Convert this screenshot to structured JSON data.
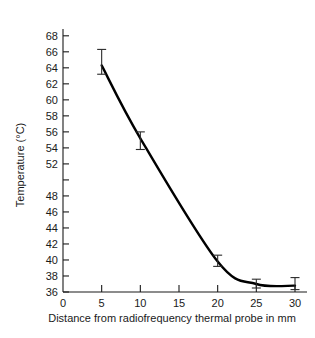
{
  "chart_data": {
    "type": "line",
    "title": "",
    "subtitle": "",
    "xlabel": "Distance from radiofrequency thermal probe in mm",
    "ylabel": "Temperature (°C)",
    "x": [
      5,
      10,
      20,
      25,
      30
    ],
    "values": [
      64.3,
      55.2,
      39.8,
      37.0,
      36.8
    ],
    "error_upper": [
      66.3,
      56.0,
      40.6,
      37.6,
      37.8
    ],
    "error_lower": [
      63.2,
      53.8,
      39.2,
      36.5,
      36.3
    ],
    "series": [
      {
        "name": "Temperature",
        "values": [
          64.3,
          55.2,
          39.8,
          37.0,
          36.8
        ]
      }
    ],
    "xlim": [
      0,
      31
    ],
    "ylim": [
      36,
      68.6
    ],
    "xticks": [
      0,
      5,
      10,
      15,
      20,
      25,
      30
    ],
    "xtick_labels": [
      "0",
      "5",
      "10",
      "15",
      "20",
      "25",
      "30"
    ],
    "yticks": [
      36,
      38,
      40,
      42,
      44,
      46,
      48,
      50,
      52,
      54,
      56,
      58,
      60,
      62,
      64,
      66,
      68
    ],
    "ytick_labels": [
      "36",
      "38",
      "40",
      "42",
      "44",
      "46",
      "48",
      "",
      "52",
      "54",
      "56",
      "58",
      "60",
      "62",
      "64",
      "66",
      "68"
    ],
    "grid": false,
    "legend": false,
    "legend_position": "none",
    "annotations": [],
    "colors": {
      "curve": "#000000",
      "axis": "#1a1a1a",
      "errorbar": "#2a2a2a",
      "background": "#ffffff"
    }
  }
}
